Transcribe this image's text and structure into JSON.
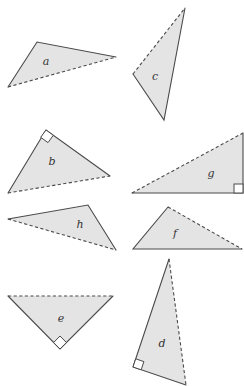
{
  "diagram": {
    "title": "",
    "fill_color": "#e4e4e4",
    "stroke_color": "#4a4a4a",
    "triangles": [
      {
        "label": "a",
        "right_angle": false,
        "dashed_side": "long side (bottom)"
      },
      {
        "label": "b",
        "right_angle": true,
        "dashed_side": "hypotenuse"
      },
      {
        "label": "c",
        "right_angle": false,
        "dashed_side": "upper-left side"
      },
      {
        "label": "d",
        "right_angle": true,
        "dashed_side": "hypotenuse"
      },
      {
        "label": "e",
        "right_angle": true,
        "dashed_side": "hypotenuse"
      },
      {
        "label": "f",
        "right_angle": false,
        "dashed_side": "upper-right side"
      },
      {
        "label": "g",
        "right_angle": true,
        "dashed_side": "hypotenuse"
      },
      {
        "label": "h",
        "right_angle": false,
        "dashed_side": "lower side"
      }
    ]
  }
}
